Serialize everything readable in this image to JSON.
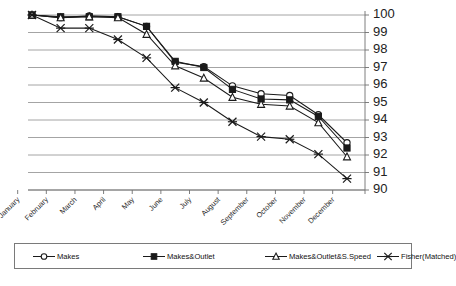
{
  "chart_data": {
    "type": "line",
    "title": "",
    "subtitle": "",
    "xlabel": "",
    "ylabel": "",
    "ylim": [
      90,
      100
    ],
    "xlim_categories": 12,
    "grid": true,
    "grid_axis": "y",
    "y_axis_position": "right",
    "legend_position": "bottom",
    "yticks": [
      100,
      99,
      98,
      97,
      96,
      95,
      94,
      93,
      92,
      91,
      90
    ],
    "ytick_labels": [
      "100",
      "99",
      "98",
      "97",
      "96",
      "95",
      "94",
      "93",
      "92",
      "91",
      "90"
    ],
    "categories": [
      "January",
      "February",
      "March",
      "April",
      "May",
      "June",
      "July",
      "August",
      "September",
      "October",
      "November",
      "December"
    ],
    "series": [
      {
        "name": "Makes",
        "marker": "open-circle",
        "color": "#1a1a1a",
        "values": [
          100,
          99.85,
          99.95,
          99.9,
          99.35,
          97.3,
          97.05,
          95.95,
          95.5,
          95.4,
          94.3,
          92.7
        ]
      },
      {
        "name": "Makes&Outlet",
        "marker": "filled-square",
        "color": "#1a1a1a",
        "values": [
          100,
          99.9,
          99.9,
          99.9,
          99.35,
          97.35,
          97.0,
          95.75,
          95.2,
          95.15,
          94.2,
          92.4
        ]
      },
      {
        "name": "Makes&Outlet&S.Speed",
        "marker": "open-triangle",
        "color": "#1a1a1a",
        "values": [
          100,
          99.85,
          99.9,
          99.85,
          98.9,
          97.1,
          96.4,
          95.3,
          94.9,
          94.8,
          93.85,
          91.9
        ]
      },
      {
        "name": "Fisher(Matched)",
        "marker": "cross-x",
        "color": "#1a1a1a",
        "values": [
          100,
          99.25,
          99.25,
          98.6,
          97.55,
          95.85,
          95.0,
          93.9,
          93.05,
          92.9,
          92.05,
          90.65
        ]
      }
    ]
  },
  "legend": {
    "entries": [
      {
        "label": "Makes",
        "marker": "open-circle"
      },
      {
        "label": "Makes&Outlet",
        "marker": "filled-square"
      },
      {
        "label": "Makes&Outlet&S.Speed",
        "marker": "open-triangle"
      },
      {
        "label": "Fisher(Matched)",
        "marker": "cross-x"
      }
    ]
  },
  "colors": {
    "line": "#1a1a1a",
    "grid": "#8d8d8d",
    "axis": "#6f6f6f",
    "text": "#111111",
    "background": "#ffffff"
  }
}
